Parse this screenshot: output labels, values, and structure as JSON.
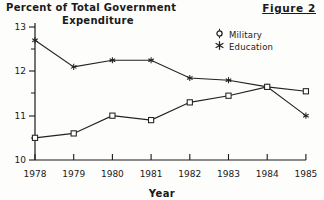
{
  "figure": {
    "label": "Figure 2",
    "title_line1": "Percent of Total Government",
    "title_line2": "Expenditure",
    "xaxis_title": "Year"
  },
  "legend": {
    "position": "top-right",
    "entries": [
      {
        "label": "Military",
        "marker": "open-circle-icon",
        "glyph": "¤"
      },
      {
        "label": "Education",
        "marker": "asterisk-icon",
        "glyph": "✳"
      }
    ]
  },
  "axes": {
    "y_ticks": [
      "13",
      "12",
      "11",
      "10"
    ],
    "x_ticks": [
      "1978",
      "1979",
      "1980",
      "1981",
      "1982",
      "1983",
      "1984",
      "1985"
    ]
  },
  "colors": {
    "ink": "#1a1a1a",
    "line": "#222222",
    "background": "#fdfdfb"
  },
  "chart_data": {
    "type": "line",
    "title": "Percent of Total Government Expenditure",
    "xlabel": "Year",
    "ylabel": "Percent of Total Government Expenditure",
    "x": [
      1978,
      1979,
      1980,
      1981,
      1982,
      1983,
      1984,
      1985
    ],
    "categories": [
      "1978",
      "1979",
      "1980",
      "1981",
      "1982",
      "1983",
      "1984",
      "1985"
    ],
    "ylim": [
      10,
      13
    ],
    "xlim": [
      1978,
      1985
    ],
    "yticks": [
      10,
      11,
      12,
      13
    ],
    "grid": false,
    "legend_position": "top-right",
    "series": [
      {
        "name": "Military",
        "marker": "open-square",
        "values": [
          10.5,
          10.6,
          11.0,
          10.9,
          11.3,
          11.45,
          11.65,
          11.55
        ]
      },
      {
        "name": "Education",
        "marker": "asterisk",
        "values": [
          12.7,
          12.1,
          12.25,
          12.25,
          11.85,
          11.8,
          11.65,
          11.0
        ]
      }
    ]
  }
}
